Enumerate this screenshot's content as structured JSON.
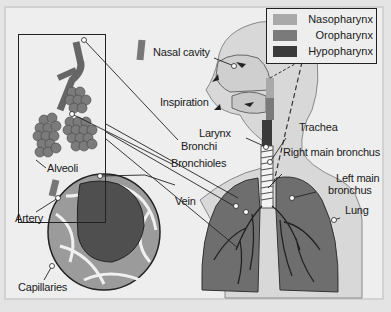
{
  "diagram": {
    "legend": [
      {
        "label": "Nasopharynx",
        "color": "#a9a9a9"
      },
      {
        "label": "Oropharynx",
        "color": "#7a7a7a"
      },
      {
        "label": "Hypopharynx",
        "color": "#3a3a3a"
      }
    ],
    "labels": {
      "nasal_cavity": "Nasal cavity",
      "inspiration": "Inspiration",
      "larynx": "Larynx",
      "bronchi": "Bronchi",
      "bronchioles": "Bronchioles",
      "trachea": "Trachea",
      "right_main_bronchus": "Right main bronchus",
      "left_main_bronchus_1": "Left main",
      "left_main_bronchus_2": "bronchus",
      "lung": "Lung",
      "alveoli": "Alveoli",
      "vein": "Vein",
      "artery": "Artery",
      "capillaries": "Capillaries"
    },
    "colors": {
      "background": "#eeeeee",
      "body": "#d8d8d8",
      "lung": "#6e6e6e",
      "alveolus_dark": "#5a5a5a",
      "outline": "#222222"
    }
  }
}
